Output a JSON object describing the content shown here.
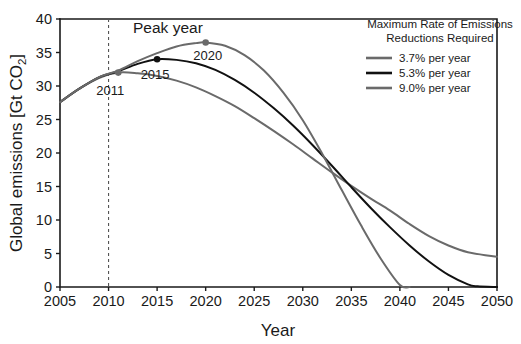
{
  "chart_data": {
    "type": "line",
    "title": "",
    "xlabel": "Year",
    "ylabel": "Global emissions [Gt CO2]",
    "ylabel_main": "Global emissions [Gt CO",
    "ylabel_sub": "2",
    "ylabel_tail": "]",
    "xlim": [
      2005,
      2050
    ],
    "ylim": [
      0,
      40
    ],
    "xticks": [
      2005,
      2010,
      2015,
      2020,
      2025,
      2030,
      2035,
      2040,
      2045,
      2050
    ],
    "yticks": [
      0,
      5,
      10,
      15,
      20,
      25,
      30,
      35,
      40
    ],
    "grid": false,
    "legend_position": "top-right",
    "legend_title_line1": "Maximum Rate of Emissions",
    "legend_title_line2": "Reductions Required",
    "annotation": "Peak year",
    "reference_line": {
      "axis": "x",
      "value": 2010,
      "style": "dashed"
    },
    "series": [
      {
        "name": "3.7% per year",
        "color": "#6a6a6a",
        "peak_label": "2011",
        "peak_x": 2011,
        "peak_y": 32.0,
        "x": [
          2005,
          2007,
          2009,
          2011,
          2013,
          2015,
          2017,
          2019,
          2021,
          2023,
          2025,
          2027,
          2029,
          2031,
          2033,
          2035,
          2037,
          2039,
          2041,
          2043,
          2045,
          2047,
          2050
        ],
        "y": [
          27.6,
          29.6,
          31.2,
          32.0,
          31.9,
          31.5,
          30.8,
          29.8,
          28.5,
          27.0,
          25.2,
          23.3,
          21.3,
          19.2,
          17.1,
          15.1,
          13.2,
          11.4,
          9.4,
          7.6,
          6.2,
          5.2,
          4.5
        ]
      },
      {
        "name": "5.3% per year",
        "color": "#111111",
        "peak_label": "2015",
        "peak_x": 2015,
        "peak_y": 34.0,
        "x": [
          2005,
          2007,
          2009,
          2011,
          2013,
          2015,
          2017,
          2019,
          2021,
          2023,
          2025,
          2027,
          2029,
          2031,
          2033,
          2035,
          2037,
          2039,
          2041,
          2043,
          2045,
          2047,
          2048,
          2050
        ],
        "y": [
          27.6,
          29.6,
          31.3,
          32.2,
          33.3,
          34.0,
          33.9,
          33.4,
          32.4,
          30.9,
          29.0,
          26.7,
          24.1,
          21.2,
          18.1,
          14.9,
          11.8,
          8.9,
          6.2,
          3.8,
          1.8,
          0.4,
          0.1,
          0.0
        ]
      },
      {
        "name": "9.0% per year",
        "color": "#6a6a6a",
        "peak_label": "2020",
        "peak_x": 2020,
        "peak_y": 36.5,
        "x": [
          2005,
          2007,
          2009,
          2011,
          2013,
          2015,
          2017,
          2019,
          2020,
          2022,
          2024,
          2026,
          2028,
          2030,
          2032,
          2034,
          2036,
          2038,
          2040,
          2041
        ],
        "y": [
          27.6,
          29.6,
          31.3,
          32.3,
          33.7,
          34.9,
          35.9,
          36.4,
          36.5,
          36.0,
          34.6,
          32.3,
          29.0,
          24.9,
          19.9,
          14.5,
          9.2,
          4.3,
          0.3,
          0.0
        ]
      }
    ]
  }
}
